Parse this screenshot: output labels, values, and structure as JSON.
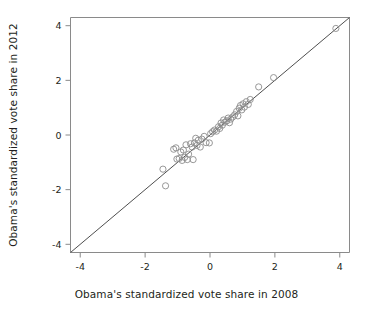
{
  "chart_data": {
    "type": "scatter",
    "title": "",
    "xlabel": "Obama's standardized vote share in 2008",
    "ylabel": "Obama's standardized vote share in 2012",
    "xlim": [
      -4.3,
      4.3
    ],
    "ylim": [
      -4.3,
      4.3
    ],
    "xticks": [
      -4,
      -2,
      0,
      2,
      4
    ],
    "yticks": [
      -4,
      -2,
      0,
      2,
      4
    ],
    "xticklabels": [
      "-4",
      "-2",
      "0",
      "2",
      "4"
    ],
    "yticklabels": [
      "-4",
      "-2",
      "0",
      "2",
      "4"
    ],
    "grid": false,
    "legend": null,
    "marker": "open-circle",
    "marker_color": "#8c8c8c",
    "reference_line": {
      "name": "identity-line",
      "type": "line",
      "equation": "y = x",
      "from": [
        -4.3,
        -4.3
      ],
      "to": [
        4.3,
        4.3
      ],
      "color": "#3a3a3a"
    },
    "points": [
      [
        -1.45,
        -1.25
      ],
      [
        -1.37,
        -1.86
      ],
      [
        -1.12,
        -0.52
      ],
      [
        -1.05,
        -0.47
      ],
      [
        -1.02,
        -0.88
      ],
      [
        -0.95,
        -0.86
      ],
      [
        -0.9,
        -0.62
      ],
      [
        -0.86,
        -0.93
      ],
      [
        -0.82,
        -0.55
      ],
      [
        -0.78,
        -0.82
      ],
      [
        -0.74,
        -0.36
      ],
      [
        -0.7,
        -0.9
      ],
      [
        -0.66,
        -0.7
      ],
      [
        -0.6,
        -0.32
      ],
      [
        -0.55,
        -0.44
      ],
      [
        -0.52,
        -0.9
      ],
      [
        -0.48,
        -0.29
      ],
      [
        -0.44,
        -0.12
      ],
      [
        -0.4,
        -0.38
      ],
      [
        -0.36,
        -0.19
      ],
      [
        -0.3,
        -0.44
      ],
      [
        -0.25,
        -0.15
      ],
      [
        -0.18,
        -0.05
      ],
      [
        -0.12,
        -0.28
      ],
      [
        -0.02,
        -0.29
      ],
      [
        0.02,
        0.05
      ],
      [
        0.08,
        0.12
      ],
      [
        0.14,
        0.18
      ],
      [
        0.2,
        0.14
      ],
      [
        0.26,
        0.3
      ],
      [
        0.3,
        0.24
      ],
      [
        0.34,
        0.44
      ],
      [
        0.38,
        0.36
      ],
      [
        0.42,
        0.55
      ],
      [
        0.46,
        0.47
      ],
      [
        0.52,
        0.52
      ],
      [
        0.56,
        0.62
      ],
      [
        0.6,
        0.45
      ],
      [
        0.64,
        0.58
      ],
      [
        0.7,
        0.66
      ],
      [
        0.76,
        0.74
      ],
      [
        0.82,
        0.86
      ],
      [
        0.86,
        0.7
      ],
      [
        0.9,
        0.98
      ],
      [
        0.94,
        1.08
      ],
      [
        0.98,
        0.92
      ],
      [
        1.02,
        1.14
      ],
      [
        1.06,
        1.02
      ],
      [
        1.12,
        1.22
      ],
      [
        1.18,
        1.12
      ],
      [
        1.24,
        1.3
      ],
      [
        1.5,
        1.76
      ],
      [
        1.96,
        2.1
      ],
      [
        3.88,
        3.9
      ]
    ]
  }
}
